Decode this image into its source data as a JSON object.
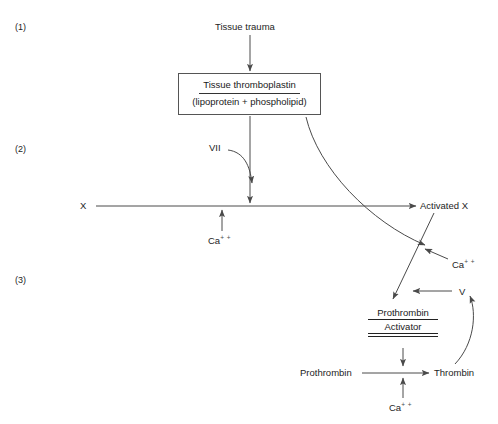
{
  "diagram": {
    "steps": [
      {
        "id": "step-1",
        "label": "(1)"
      },
      {
        "id": "step-2",
        "label": "(2)"
      },
      {
        "id": "step-3",
        "label": "(3)"
      }
    ],
    "nodes": {
      "tissue_trauma": "Tissue trauma",
      "thromboplastin_numerator": "Tissue thromboplastin",
      "thromboplastin_denominator": "(lipoprotein  +  phospholipid)",
      "factor_vii": "VII",
      "factor_x": "X",
      "activated_x": "Activated X",
      "factor_v": "V",
      "prothrombin_activator_numerator": "Prothrombin",
      "prothrombin_activator_denominator": "Activator",
      "prothrombin": "Prothrombin",
      "thrombin": "Thrombin"
    },
    "ions": {
      "calcium_x": "Ca",
      "calcium_x_charge": "+ +",
      "calcium_activator": "Ca",
      "calcium_activator_charge": "+ +",
      "calcium_thrombin": "Ca",
      "calcium_thrombin_charge": "+ +"
    },
    "colors": {
      "ink": "#1d1d1d",
      "stroke": "#4a4a4a",
      "box_border": "#555555",
      "background": "#ffffff"
    }
  }
}
